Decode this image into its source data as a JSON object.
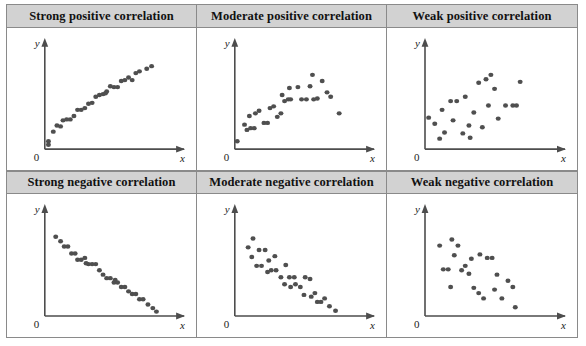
{
  "figure": {
    "kind": "scatterplot-matrix",
    "columns": 3,
    "rows": 2,
    "dot_color": "#4f4f4f",
    "header_background": "#d2d2d2",
    "border_color": "#8a8a8a",
    "axis_color": "#4d4d4d"
  },
  "axis": {
    "x_label": "x",
    "y_label": "y",
    "origin_label": "0"
  },
  "panels": [
    {
      "id": "strong-positive",
      "title": "Strong positive correlation",
      "chart_data": {
        "type": "scatter",
        "title": "Strong positive correlation",
        "xlabel": "x",
        "ylabel": "y",
        "xlim": [
          0,
          100
        ],
        "ylim": [
          0,
          100
        ],
        "grid": false,
        "legend": "none",
        "points": [
          [
            3,
            9
          ],
          [
            3,
            5
          ],
          [
            7,
            20
          ],
          [
            10,
            27
          ],
          [
            13,
            26
          ],
          [
            15,
            33
          ],
          [
            18,
            34
          ],
          [
            21,
            34
          ],
          [
            24,
            38
          ],
          [
            27,
            45
          ],
          [
            30,
            45
          ],
          [
            33,
            47
          ],
          [
            36,
            52
          ],
          [
            39,
            53
          ],
          [
            42,
            60
          ],
          [
            45,
            62
          ],
          [
            48,
            63
          ],
          [
            51,
            66
          ],
          [
            54,
            72
          ],
          [
            57,
            71
          ],
          [
            60,
            71
          ],
          [
            63,
            78
          ],
          [
            66,
            79
          ],
          [
            69,
            82
          ],
          [
            72,
            79
          ],
          [
            75,
            87
          ],
          [
            78,
            89
          ],
          [
            84,
            92
          ],
          [
            88,
            95
          ],
          [
            50,
            64
          ]
        ]
      }
    },
    {
      "id": "moderate-positive",
      "title": "Moderate positive correlation",
      "chart_data": {
        "type": "scatter",
        "title": "Moderate positive correlation",
        "xlabel": "x",
        "ylabel": "y",
        "xlim": [
          0,
          100
        ],
        "ylim": [
          0,
          100
        ],
        "grid": false,
        "legend": "none",
        "points": [
          [
            2,
            9
          ],
          [
            8,
            28
          ],
          [
            10,
            22
          ],
          [
            13,
            24
          ],
          [
            16,
            24
          ],
          [
            12,
            38
          ],
          [
            17,
            41
          ],
          [
            20,
            44
          ],
          [
            24,
            30
          ],
          [
            27,
            30
          ],
          [
            29,
            47
          ],
          [
            32,
            49
          ],
          [
            35,
            37
          ],
          [
            38,
            41
          ],
          [
            41,
            55
          ],
          [
            44,
            57
          ],
          [
            46,
            57
          ],
          [
            39,
            62
          ],
          [
            45,
            70
          ],
          [
            52,
            71
          ],
          [
            55,
            57
          ],
          [
            59,
            57
          ],
          [
            62,
            72
          ],
          [
            65,
            57
          ],
          [
            68,
            58
          ],
          [
            64,
            85
          ],
          [
            72,
            78
          ],
          [
            76,
            65
          ],
          [
            79,
            60
          ],
          [
            86,
            41
          ]
        ]
      }
    },
    {
      "id": "weak-positive",
      "title": "Weak positive correlation",
      "chart_data": {
        "type": "scatter",
        "title": "Weak positive correlation",
        "xlabel": "x",
        "ylabel": "y",
        "xlim": [
          0,
          100
        ],
        "ylim": [
          0,
          100
        ],
        "grid": false,
        "legend": "none",
        "points": [
          [
            3,
            36
          ],
          [
            8,
            29
          ],
          [
            12,
            12
          ],
          [
            16,
            19
          ],
          [
            14,
            45
          ],
          [
            21,
            55
          ],
          [
            26,
            55
          ],
          [
            23,
            33
          ],
          [
            33,
            60
          ],
          [
            31,
            18
          ],
          [
            37,
            13
          ],
          [
            40,
            42
          ],
          [
            44,
            76
          ],
          [
            50,
            80
          ],
          [
            47,
            25
          ],
          [
            54,
            85
          ],
          [
            57,
            69
          ],
          [
            60,
            35
          ],
          [
            66,
            50
          ],
          [
            72,
            50
          ],
          [
            75,
            50
          ],
          [
            78,
            77
          ],
          [
            52,
            50
          ],
          [
            36,
            27
          ]
        ]
      }
    },
    {
      "id": "strong-negative",
      "title": "Strong negative correlation",
      "chart_data": {
        "type": "scatter",
        "title": "Strong negative correlation",
        "xlabel": "x",
        "ylabel": "y",
        "xlim": [
          0,
          100
        ],
        "ylim": [
          0,
          100
        ],
        "grid": false,
        "legend": "none",
        "points": [
          [
            9,
            90
          ],
          [
            13,
            85
          ],
          [
            16,
            79
          ],
          [
            19,
            79
          ],
          [
            22,
            71
          ],
          [
            25,
            71
          ],
          [
            27,
            64
          ],
          [
            30,
            64
          ],
          [
            33,
            66
          ],
          [
            36,
            59
          ],
          [
            39,
            59
          ],
          [
            42,
            59
          ],
          [
            45,
            52
          ],
          [
            48,
            47
          ],
          [
            51,
            43
          ],
          [
            54,
            43
          ],
          [
            57,
            38
          ],
          [
            60,
            38
          ],
          [
            63,
            33
          ],
          [
            66,
            33
          ],
          [
            69,
            28
          ],
          [
            72,
            25
          ],
          [
            75,
            25
          ],
          [
            78,
            19
          ],
          [
            81,
            19
          ],
          [
            85,
            13
          ],
          [
            89,
            9
          ],
          [
            92,
            5
          ],
          [
            34,
            60
          ],
          [
            58,
            41
          ]
        ]
      }
    },
    {
      "id": "moderate-negative",
      "title": "Moderate negative correlation",
      "chart_data": {
        "type": "scatter",
        "title": "Moderate negative correlation",
        "xlabel": "x",
        "ylabel": "y",
        "xlim": [
          0,
          100
        ],
        "ylim": [
          0,
          100
        ],
        "grid": false,
        "legend": "none",
        "points": [
          [
            11,
            78
          ],
          [
            15,
            88
          ],
          [
            14,
            67
          ],
          [
            20,
            75
          ],
          [
            25,
            75
          ],
          [
            18,
            57
          ],
          [
            22,
            57
          ],
          [
            28,
            63
          ],
          [
            30,
            52
          ],
          [
            34,
            52
          ],
          [
            33,
            68
          ],
          [
            38,
            44
          ],
          [
            42,
            58
          ],
          [
            45,
            44
          ],
          [
            49,
            44
          ],
          [
            41,
            36
          ],
          [
            46,
            33
          ],
          [
            50,
            36
          ],
          [
            54,
            33
          ],
          [
            58,
            44
          ],
          [
            62,
            42
          ],
          [
            57,
            24
          ],
          [
            63,
            22
          ],
          [
            66,
            26
          ],
          [
            68,
            16
          ],
          [
            71,
            16
          ],
          [
            74,
            20
          ],
          [
            78,
            11
          ],
          [
            83,
            6
          ],
          [
            27,
            50
          ]
        ]
      }
    },
    {
      "id": "weak-negative",
      "title": "Weak negative correlation",
      "chart_data": {
        "type": "scatter",
        "title": "Weak negative correlation",
        "xlabel": "x",
        "ylabel": "y",
        "xlim": [
          0,
          100
        ],
        "ylim": [
          0,
          100
        ],
        "grid": false,
        "legend": "none",
        "points": [
          [
            12,
            80
          ],
          [
            22,
            87
          ],
          [
            27,
            80
          ],
          [
            24,
            69
          ],
          [
            15,
            53
          ],
          [
            19,
            53
          ],
          [
            21,
            33
          ],
          [
            30,
            52
          ],
          [
            36,
            48
          ],
          [
            38,
            65
          ],
          [
            45,
            70
          ],
          [
            51,
            66
          ],
          [
            55,
            66
          ],
          [
            44,
            26
          ],
          [
            40,
            32
          ],
          [
            48,
            20
          ],
          [
            57,
            30
          ],
          [
            59,
            47
          ],
          [
            63,
            20
          ],
          [
            68,
            40
          ],
          [
            72,
            33
          ],
          [
            74,
            10
          ],
          [
            33,
            57
          ]
        ]
      }
    }
  ]
}
